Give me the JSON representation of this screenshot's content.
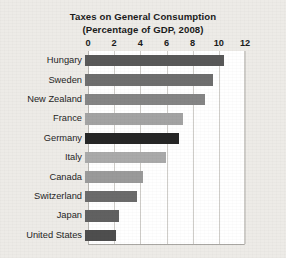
{
  "chart_data": {
    "type": "bar",
    "orientation": "horizontal",
    "title": "Taxes on General Consumption",
    "subtitle": "(Percentage of GDP, 2008)",
    "title_lines": [
      "Taxes on General Consumption",
      "(Percentage of GDP, 2008)"
    ],
    "xlabel": "",
    "ylabel": "",
    "xlim": [
      0,
      12
    ],
    "ticks": [
      "0",
      "2",
      "4",
      "6",
      "8",
      "10",
      "12"
    ],
    "tick_values": [
      0,
      2,
      4,
      6,
      8,
      10,
      12
    ],
    "grid": "vertical",
    "legend": "none",
    "categories": [
      "Hungary",
      "Sweden",
      "New Zealand",
      "France",
      "Germany",
      "Italy",
      "Canada",
      "Switzerland",
      "Japan",
      "United States"
    ],
    "values": [
      10.6,
      9.8,
      9.2,
      7.5,
      7.2,
      6.2,
      4.4,
      4.0,
      2.6,
      2.4
    ],
    "bar_colors": [
      "#585858",
      "#6e6e6e",
      "#858585",
      "#a3a3a3",
      "#262626",
      "#aaaaaa",
      "#9a9a9a",
      "#6b6b6b",
      "#616161",
      "#4e4e4e"
    ],
    "bars": [
      {
        "label": "Hungary",
        "value": 10.6,
        "color": "#585858"
      },
      {
        "label": "Sweden",
        "value": 9.8,
        "color": "#6e6e6e"
      },
      {
        "label": "New Zealand",
        "value": 9.2,
        "color": "#858585"
      },
      {
        "label": "France",
        "value": 7.5,
        "color": "#a3a3a3"
      },
      {
        "label": "Germany",
        "value": 7.2,
        "color": "#262626"
      },
      {
        "label": "Italy",
        "value": 6.2,
        "color": "#aaaaaa"
      },
      {
        "label": "Canada",
        "value": 4.4,
        "color": "#9a9a9a"
      },
      {
        "label": "Switzerland",
        "value": 4.0,
        "color": "#6b6b6b"
      },
      {
        "label": "Japan",
        "value": 2.6,
        "color": "#616161"
      },
      {
        "label": "United States",
        "value": 2.4,
        "color": "#4e4e4e"
      }
    ]
  },
  "style": {
    "page_background": "#edebe7",
    "plot_background": "#ffffff",
    "grid_color": "#cfcdc9",
    "text_color": "#1b1b1b"
  }
}
